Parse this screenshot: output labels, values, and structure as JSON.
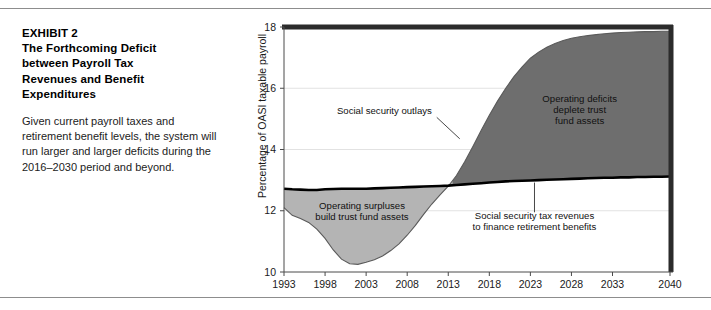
{
  "caption": {
    "title_lines": [
      "EXHIBIT 2",
      "The Forthcoming Deficit",
      "between Payroll Tax",
      "Revenues and Benefit",
      "Expenditures"
    ],
    "body": "Given current payroll taxes and retirement benefit levels, the system will run larger and larger deficits during the 2016–2030 period and beyond."
  },
  "colors": {
    "surplus_fill": "#b4b4b4",
    "deficit_fill": "#6e6e6e",
    "revenue_line": "#000000",
    "outlay_line": "#5a5a5a",
    "frame": "#2b2b2b",
    "axis": "#4a4a4a",
    "grid": "#e2e2e2",
    "rule": "#8d8d8d"
  },
  "chart_data": {
    "type": "area",
    "title": "",
    "xlabel": "",
    "ylabel": "Percentage of OASI taxable payroll",
    "xlim": [
      1993,
      2040
    ],
    "ylim": [
      10,
      18
    ],
    "yticks": [
      10,
      12,
      14,
      16,
      18
    ],
    "xticks": [
      1993,
      1998,
      2003,
      2008,
      2013,
      2018,
      2023,
      2028,
      2033,
      2040
    ],
    "grid": true,
    "legend": "none",
    "crossover_year": 2013.5,
    "x": [
      1993,
      1994,
      1995,
      1996,
      1997,
      1998,
      1999,
      2000,
      2001,
      2002,
      2003,
      2004,
      2005,
      2006,
      2007,
      2008,
      2009,
      2010,
      2011,
      2012,
      2013,
      2014,
      2015,
      2016,
      2017,
      2018,
      2019,
      2020,
      2021,
      2022,
      2023,
      2024,
      2025,
      2026,
      2027,
      2028,
      2029,
      2030,
      2031,
      2032,
      2033,
      2034,
      2035,
      2036,
      2037,
      2038,
      2039,
      2040
    ],
    "series": [
      {
        "name": "Social security outlays",
        "values": [
          12.1,
          11.85,
          11.75,
          11.62,
          11.4,
          11.1,
          10.72,
          10.42,
          10.27,
          10.25,
          10.32,
          10.4,
          10.52,
          10.7,
          10.92,
          11.2,
          11.52,
          11.88,
          12.22,
          12.52,
          12.8,
          13.15,
          13.6,
          14.1,
          14.62,
          15.12,
          15.58,
          16.0,
          16.38,
          16.7,
          16.98,
          17.18,
          17.34,
          17.46,
          17.56,
          17.63,
          17.68,
          17.72,
          17.75,
          17.78,
          17.8,
          17.82,
          17.83,
          17.84,
          17.85,
          17.85,
          17.86,
          17.86
        ]
      },
      {
        "name": "Social security tax revenues to finance retirement benefits",
        "values": [
          12.72,
          12.7,
          12.69,
          12.68,
          12.68,
          12.7,
          12.71,
          12.72,
          12.72,
          12.72,
          12.72,
          12.73,
          12.74,
          12.75,
          12.76,
          12.77,
          12.78,
          12.79,
          12.8,
          12.81,
          12.82,
          12.84,
          12.86,
          12.88,
          12.9,
          12.92,
          12.94,
          12.96,
          12.97,
          12.98,
          12.99,
          13.0,
          13.01,
          13.02,
          13.03,
          13.04,
          13.05,
          13.06,
          13.07,
          13.08,
          13.08,
          13.09,
          13.09,
          13.1,
          13.1,
          13.11,
          13.11,
          13.12
        ]
      }
    ],
    "annotations": [
      {
        "id": "outlays-label",
        "text": "Social security outlays",
        "x": 2011.0,
        "y": 15.15
      },
      {
        "id": "deficit-label",
        "lines": [
          "Operating deficits",
          "deplete trust",
          "fund assets"
        ],
        "x": 2029.0,
        "y": 15.55
      },
      {
        "id": "surplus-label",
        "lines": [
          "Operating surpluses",
          "build trust fund assets"
        ],
        "x": 2002.5,
        "y": 12.05
      },
      {
        "id": "revenue-label",
        "lines": [
          "Social security tax revenues",
          "to finance retirement benefits"
        ],
        "x": 2023.5,
        "y": 11.72
      }
    ]
  }
}
